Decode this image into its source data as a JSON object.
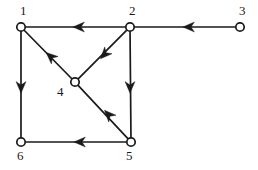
{
  "figure": {
    "type": "directed-graph",
    "width": 258,
    "height": 170,
    "background_color": "#ffffff",
    "stroke_color": "#1a1a1a",
    "node_fill_color": "#ffffff",
    "node_radius": 4.2
  },
  "nodes": [
    {
      "id": "1",
      "label": "1",
      "x": 21,
      "y": 27,
      "label_x": 20,
      "label_y": 4,
      "label_anchor": "above-left"
    },
    {
      "id": "2",
      "label": "2",
      "x": 130,
      "y": 27,
      "label_x": 129,
      "label_y": 4,
      "label_anchor": "above-left"
    },
    {
      "id": "3",
      "label": "3",
      "x": 240,
      "y": 27,
      "label_x": 239,
      "label_y": 4,
      "label_anchor": "above-left"
    },
    {
      "id": "4",
      "label": "4",
      "x": 75,
      "y": 82,
      "label_x": 57,
      "label_y": 85,
      "label_anchor": "left-below"
    },
    {
      "id": "5",
      "label": "5",
      "x": 131,
      "y": 142,
      "label_x": 126,
      "label_y": 149,
      "label_anchor": "below"
    },
    {
      "id": "6",
      "label": "6",
      "x": 21,
      "y": 142,
      "label_x": 17,
      "label_y": 149,
      "label_anchor": "below"
    }
  ],
  "edges": [
    {
      "id": "e-2-1",
      "from": "2",
      "to": "1",
      "direction": "2->1",
      "arrow_direction": "left",
      "arrow_x": 78,
      "arrow_y": 27,
      "arrow_angle": 180
    },
    {
      "id": "e-3-2",
      "from": "3",
      "to": "2",
      "direction": "3->2",
      "arrow_direction": "left",
      "arrow_x": 188,
      "arrow_y": 27,
      "arrow_angle": 180
    },
    {
      "id": "e-1-6",
      "from": "1",
      "to": "6",
      "direction": "1->6",
      "arrow_direction": "down",
      "arrow_x": 21,
      "arrow_y": 88,
      "arrow_angle": 90
    },
    {
      "id": "e-2-5",
      "from": "2",
      "to": "5",
      "direction": "2->5",
      "arrow_direction": "down",
      "arrow_x": 130,
      "arrow_y": 88,
      "arrow_angle": 90
    },
    {
      "id": "e-5-6",
      "from": "5",
      "to": "6",
      "direction": "5->6",
      "arrow_direction": "left",
      "arrow_x": 79,
      "arrow_y": 142,
      "arrow_angle": 180
    },
    {
      "id": "e-2-4",
      "from": "2",
      "to": "4",
      "direction": "2->4",
      "arrow_direction": "down-left",
      "arrow_x": 104,
      "arrow_y": 55,
      "arrow_angle": 133
    },
    {
      "id": "e-5-4",
      "from": "5",
      "to": "4",
      "direction": "5->4",
      "arrow_direction": "up-left",
      "arrow_x": 108,
      "arrow_y": 114,
      "arrow_angle": 227
    },
    {
      "id": "e-4-1",
      "from": "4",
      "to": "1",
      "direction": "4->1",
      "arrow_direction": "up-left",
      "arrow_x": 50,
      "arrow_y": 56,
      "arrow_angle": 222
    }
  ]
}
